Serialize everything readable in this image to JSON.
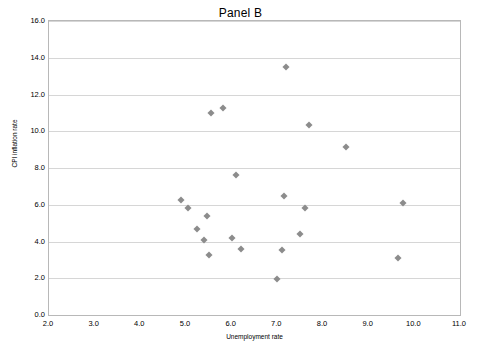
{
  "chart_data": {
    "type": "scatter",
    "title": "Panel B",
    "xlabel": "Unemployment rate",
    "ylabel": "CPI inflation rate",
    "xlim": [
      2.0,
      11.0
    ],
    "ylim": [
      0.0,
      16.0
    ],
    "xticks": [
      "2.0",
      "3.0",
      "4.0",
      "5.0",
      "6.0",
      "7.0",
      "8.0",
      "9.0",
      "10.0",
      "11.0"
    ],
    "yticks": [
      "0.0",
      "2.0",
      "4.0",
      "6.0",
      "8.0",
      "10.0",
      "12.0",
      "14.0",
      "16.0"
    ],
    "grid": "horizontal",
    "legend": "none",
    "marker": "diamond",
    "marker_color": "#8c8c8c",
    "points": [
      {
        "x": 4.9,
        "y": 6.25
      },
      {
        "x": 5.05,
        "y": 5.85
      },
      {
        "x": 5.25,
        "y": 4.7
      },
      {
        "x": 5.4,
        "y": 4.1
      },
      {
        "x": 5.45,
        "y": 5.4
      },
      {
        "x": 5.5,
        "y": 3.25
      },
      {
        "x": 5.55,
        "y": 11.0
      },
      {
        "x": 5.8,
        "y": 11.25
      },
      {
        "x": 6.0,
        "y": 4.2
      },
      {
        "x": 6.1,
        "y": 7.6
      },
      {
        "x": 6.2,
        "y": 3.6
      },
      {
        "x": 7.0,
        "y": 1.95
      },
      {
        "x": 7.1,
        "y": 3.55
      },
      {
        "x": 7.15,
        "y": 6.45
      },
      {
        "x": 7.2,
        "y": 13.5
      },
      {
        "x": 7.5,
        "y": 4.4
      },
      {
        "x": 7.6,
        "y": 5.8
      },
      {
        "x": 7.7,
        "y": 10.35
      },
      {
        "x": 8.5,
        "y": 9.15
      },
      {
        "x": 9.65,
        "y": 3.1
      },
      {
        "x": 9.75,
        "y": 6.1
      }
    ]
  }
}
